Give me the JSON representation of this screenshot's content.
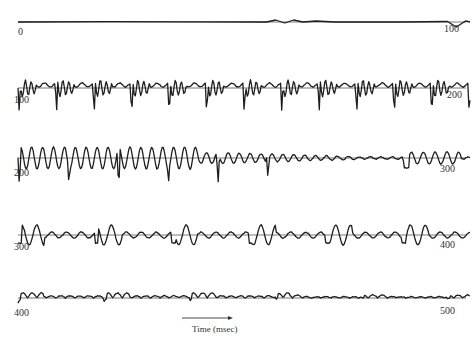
{
  "chart_data": {
    "type": "line",
    "title": "",
    "xlabel": "Time (msec)",
    "ylabel": "",
    "layout": {
      "rows": 5,
      "ms_per_row": 100,
      "grid": false,
      "legend": "none",
      "xlim": [
        0,
        500
      ]
    },
    "rows": [
      {
        "start_label": "0",
        "end_label": "100",
        "baseline_y": 22,
        "activity": "near-flat, small bump ~58-66 ms, dip at ~98 ms",
        "points": [
          [
            0,
            0
          ],
          [
            20,
            0.3
          ],
          [
            40,
            0.2
          ],
          [
            55,
            0
          ],
          [
            57,
            2
          ],
          [
            59,
            -1
          ],
          [
            61,
            2
          ],
          [
            63,
            0
          ],
          [
            66,
            1
          ],
          [
            70,
            0
          ],
          [
            85,
            0
          ],
          [
            95,
            0.5
          ],
          [
            97,
            -5
          ],
          [
            99,
            1
          ],
          [
            100,
            0
          ]
        ]
      },
      {
        "start_label": "100",
        "end_label": "200",
        "baseline_y": 88,
        "activity": "strong periodic bursts with deep negative spikes ~every 8 ms",
        "points": []
      },
      {
        "start_label": "200",
        "end_label": "300",
        "baseline_y": 158,
        "activity": "strong bursts early (200-240), decaying, small burst near 290",
        "points": []
      },
      {
        "start_label": "300",
        "end_label": "400",
        "baseline_y": 235,
        "activity": "moderate smooth oscillation bursts",
        "points": []
      },
      {
        "start_label": "400",
        "end_label": "500",
        "baseline_y": 298,
        "activity": "low-amplitude smooth oscillation",
        "points": []
      }
    ],
    "annotations": [
      {
        "text": "Time (msec)",
        "arrow": "right",
        "position": "bottom-center"
      }
    ]
  },
  "figure": {
    "x_axis_title": "Time (msec)",
    "row_labels": [
      {
        "start": "0",
        "end": "100"
      },
      {
        "start": "100",
        "end": "200"
      },
      {
        "start": "200",
        "end": "300"
      },
      {
        "start": "300",
        "end": "400"
      },
      {
        "start": "400",
        "end": "500"
      }
    ]
  }
}
